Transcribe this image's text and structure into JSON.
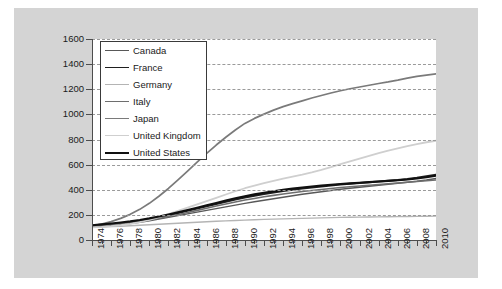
{
  "chart_data": {
    "type": "line",
    "title": "",
    "xlabel": "",
    "ylabel": "",
    "xlim": [
      1974,
      2010
    ],
    "ylim": [
      0,
      1600
    ],
    "ytick_labels": [
      "0",
      "200",
      "400",
      "600",
      "800",
      "1000",
      "1200",
      "1400",
      "1600"
    ],
    "ytick_values": [
      0,
      200,
      400,
      600,
      800,
      1000,
      1200,
      1400,
      1600
    ],
    "xtick_labels": [
      "1974",
      "1976",
      "1978",
      "1980",
      "1982",
      "1984",
      "1986",
      "1988",
      "1990",
      "1992",
      "1994",
      "1996",
      "1998",
      "2000",
      "2002",
      "2004",
      "2006",
      "2008",
      "2010"
    ],
    "xtick_values": [
      1974,
      1976,
      1978,
      1980,
      1982,
      1984,
      1986,
      1988,
      1990,
      1992,
      1994,
      1996,
      1998,
      2000,
      2002,
      2004,
      2006,
      2008,
      2010
    ],
    "minor_xticks_every": 1,
    "grid": "horizontal-dashed",
    "legend_position": "upper-left-inside",
    "x": [
      1974,
      1975,
      1976,
      1977,
      1978,
      1979,
      1980,
      1981,
      1982,
      1983,
      1984,
      1985,
      1986,
      1987,
      1988,
      1989,
      1990,
      1991,
      1992,
      1993,
      1994,
      1995,
      1996,
      1997,
      1998,
      1999,
      2000,
      2001,
      2002,
      2003,
      2004,
      2005,
      2006,
      2007,
      2008,
      2009,
      2010
    ],
    "series": [
      {
        "name": "Canada",
        "color": "#585858",
        "width": 1.4,
        "values": [
          105,
          110,
          116,
          122,
          130,
          140,
          152,
          166,
          180,
          194,
          208,
          222,
          236,
          250,
          264,
          278,
          292,
          304,
          316,
          328,
          340,
          352,
          364,
          374,
          384,
          394,
          404,
          412,
          420,
          428,
          436,
          444,
          452,
          460,
          468,
          478,
          490
        ]
      },
      {
        "name": "France",
        "color": "#1f1f1f",
        "width": 1.9,
        "values": [
          108,
          114,
          122,
          130,
          140,
          152,
          166,
          182,
          198,
          214,
          232,
          250,
          268,
          286,
          304,
          322,
          338,
          352,
          366,
          378,
          390,
          400,
          410,
          418,
          426,
          434,
          442,
          448,
          454,
          460,
          466,
          472,
          478,
          486,
          496,
          508,
          520
        ]
      },
      {
        "name": "Germany",
        "color": "#b4b4b4",
        "width": 1.4,
        "values": [
          102,
          104,
          107,
          110,
          113,
          117,
          121,
          125,
          129,
          133,
          137,
          141,
          145,
          149,
          152,
          155,
          158,
          161,
          164,
          166,
          168,
          170,
          172,
          174,
          176,
          178,
          180,
          181,
          182,
          183,
          184,
          185,
          186,
          187,
          188,
          189,
          190
        ]
      },
      {
        "name": "Italy",
        "color": "#6e6e6e",
        "width": 1.6,
        "values": [
          106,
          112,
          119,
          127,
          136,
          147,
          159,
          173,
          188,
          203,
          219,
          236,
          253,
          270,
          287,
          303,
          318,
          331,
          344,
          355,
          366,
          376,
          386,
          394,
          402,
          410,
          418,
          424,
          430,
          436,
          442,
          448,
          454,
          460,
          466,
          472,
          478
        ]
      },
      {
        "name": "Japan",
        "color": "#7a7a7a",
        "width": 1.7,
        "values": [
          112,
          126,
          146,
          172,
          204,
          244,
          292,
          348,
          410,
          478,
          548,
          620,
          690,
          756,
          818,
          876,
          928,
          968,
          1002,
          1034,
          1062,
          1086,
          1108,
          1130,
          1150,
          1170,
          1188,
          1204,
          1218,
          1232,
          1246,
          1258,
          1272,
          1288,
          1302,
          1312,
          1322
        ]
      },
      {
        "name": "United Kingdom",
        "color": "#cfcfcf",
        "width": 1.8,
        "values": [
          100,
          104,
          110,
          118,
          128,
          142,
          160,
          182,
          206,
          232,
          258,
          284,
          310,
          336,
          362,
          388,
          412,
          432,
          452,
          470,
          488,
          504,
          520,
          538,
          558,
          580,
          604,
          626,
          648,
          670,
          692,
          712,
          730,
          748,
          764,
          778,
          790
        ]
      },
      {
        "name": "United States",
        "color": "#101010",
        "width": 2.1,
        "values": [
          118,
          124,
          131,
          139,
          148,
          159,
          172,
          187,
          203,
          220,
          238,
          257,
          276,
          295,
          314,
          332,
          349,
          363,
          376,
          388,
          399,
          409,
          418,
          426,
          433,
          440,
          446,
          451,
          456,
          461,
          466,
          471,
          476,
          482,
          490,
          500,
          512
        ]
      }
    ]
  },
  "legend": {
    "items": [
      {
        "label": "Canada"
      },
      {
        "label": "France"
      },
      {
        "label": "Germany"
      },
      {
        "label": "Italy"
      },
      {
        "label": "Japan"
      },
      {
        "label": "United Kingdom"
      },
      {
        "label": "United States"
      }
    ]
  },
  "colors": {
    "figure_background": "#d4d4d4",
    "page_background": "#ffffff",
    "plot_background": "#ffffff",
    "axis": "#4d4d4d",
    "gridline": "#9a9a9a",
    "text": "#1a1a1a"
  }
}
